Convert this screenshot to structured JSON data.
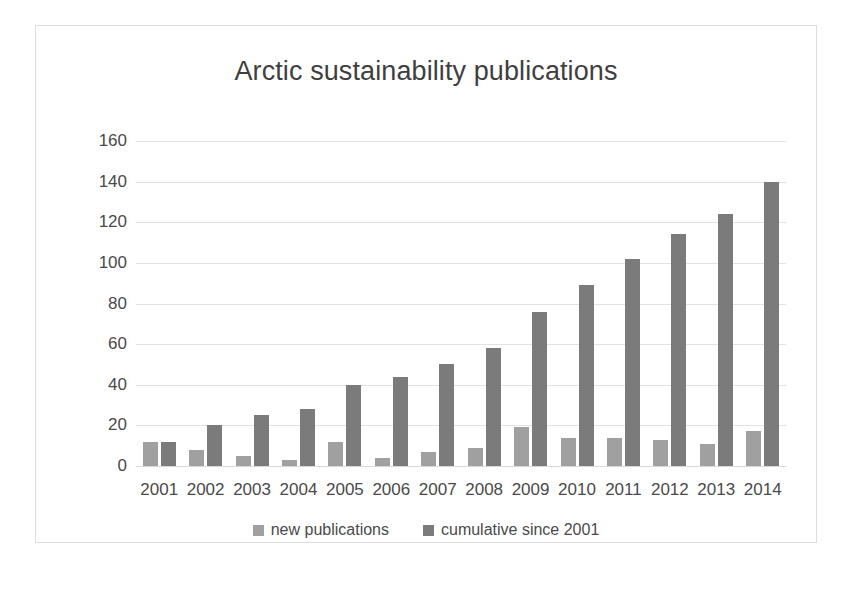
{
  "chart_data": {
    "type": "bar",
    "title": "Arctic sustainability publications",
    "xlabel": "",
    "ylabel": "",
    "categories": [
      "2001",
      "2002",
      "2003",
      "2004",
      "2005",
      "2006",
      "2007",
      "2008",
      "2009",
      "2010",
      "2011",
      "2012",
      "2013",
      "2014"
    ],
    "series": [
      {
        "name": "new publications",
        "color": "#a0a0a0",
        "values": [
          12,
          8,
          5,
          3,
          12,
          4,
          7,
          9,
          19,
          14,
          14,
          13,
          11,
          17
        ]
      },
      {
        "name": "cumulative since 2001",
        "color": "#7b7b7b",
        "values": [
          12,
          20,
          25,
          28,
          40,
          44,
          50,
          58,
          76,
          89,
          102,
          114,
          124,
          140
        ]
      }
    ],
    "ylim": [
      0,
      160
    ],
    "yticks": [
      160,
      140,
      120,
      100,
      80,
      60,
      40,
      20,
      0
    ],
    "ytick_labels": [
      "160",
      "140",
      "120",
      "100",
      "80",
      "60",
      "40",
      "20",
      "0"
    ],
    "grid": true,
    "legend_position": "bottom"
  },
  "legend": {
    "items": [
      {
        "label": "new publications"
      },
      {
        "label": "cumulative since 2001"
      }
    ]
  }
}
